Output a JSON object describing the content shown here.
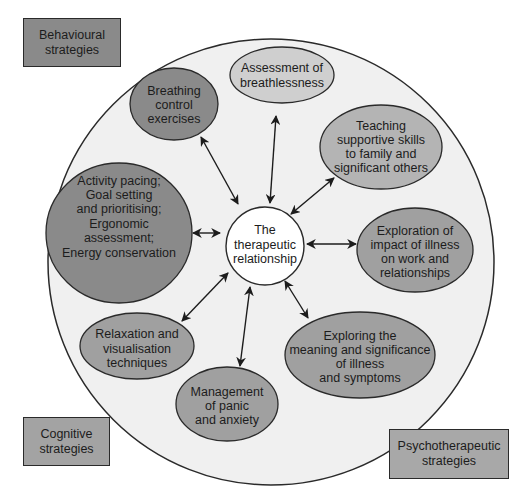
{
  "colors": {
    "outer_circle_fill": "#f0f0f0",
    "center_fill": "#ffffff",
    "dark_node": "#8a8a8a",
    "medium_node": "#a0a0a0",
    "light_node": "#cfcfcf",
    "behavioural_legend": "#8a8a8a",
    "cognitive_legend": "#a3a3a3",
    "psychotherapeutic_legend": "#a8a8a8",
    "stroke": "#2a2a2a"
  },
  "center_node": {
    "lines": [
      "The",
      "therapeutic",
      "relationship"
    ]
  },
  "nodes": [
    {
      "id": "breathing",
      "category": "behavioural",
      "lines": [
        "Breathing",
        "control",
        "exercises"
      ]
    },
    {
      "id": "assessment",
      "category": "light",
      "lines": [
        "Assessment of",
        "breathlessness"
      ]
    },
    {
      "id": "teaching",
      "category": "psychotherapeutic",
      "lines": [
        "Teaching",
        "supportive skills",
        "to family and",
        "significant others"
      ]
    },
    {
      "id": "activity",
      "category": "behavioural",
      "lines": [
        "Activity pacing;",
        "Goal setting",
        "and prioritising;",
        "Ergonomic",
        "assessment;",
        "Energy conservation"
      ]
    },
    {
      "id": "exploration",
      "category": "psychotherapeutic",
      "lines": [
        "Exploration of",
        "impact of illness",
        "on work and",
        "relationships"
      ]
    },
    {
      "id": "relaxation",
      "category": "cognitive",
      "lines": [
        "Relaxation and",
        "visualisation",
        "techniques"
      ]
    },
    {
      "id": "panic",
      "category": "cognitive",
      "lines": [
        "Management",
        "of panic",
        "and anxiety"
      ]
    },
    {
      "id": "meaning",
      "category": "psychotherapeutic",
      "lines": [
        "Exploring the",
        "meaning and significance",
        "of illness",
        "and symptoms"
      ]
    }
  ],
  "legend": {
    "behavioural": [
      "Behavioural",
      "strategies"
    ],
    "cognitive": [
      "Cognitive",
      "strategies"
    ],
    "psychotherapeutic": [
      "Psychotherapeutic",
      "strategies"
    ]
  }
}
